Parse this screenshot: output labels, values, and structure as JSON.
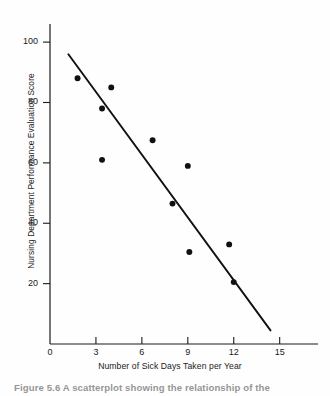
{
  "figure": {
    "caption_prefix": "Figure 5.6",
    "caption_text": "A scatterplot showing the relationship of the",
    "caption_full": "Figure 5.6  A scatterplot showing the relationship of the"
  },
  "chart_data": {
    "type": "scatter",
    "title": "",
    "xlabel": "Number of Sick Days Taken per Year",
    "ylabel": "Nursing Department Performance Evaluation Score",
    "xlim": [
      0,
      16
    ],
    "ylim": [
      0,
      106
    ],
    "xticks": [
      0,
      3,
      6,
      9,
      12,
      15
    ],
    "xtick_labels": [
      "0",
      "3",
      "6",
      "9",
      "12",
      "15"
    ],
    "yticks": [
      20,
      40,
      60,
      80,
      100
    ],
    "ytick_labels": [
      "20",
      "40",
      "60",
      "80",
      "100"
    ],
    "grid": false,
    "legend": "none",
    "marker": {
      "shape": "circle",
      "color": "#111111",
      "size": 4.6
    },
    "points": [
      {
        "x": 1.8,
        "y": 88.0
      },
      {
        "x": 3.4,
        "y": 78.0
      },
      {
        "x": 3.4,
        "y": 61.0
      },
      {
        "x": 4.0,
        "y": 85.0
      },
      {
        "x": 6.7,
        "y": 67.5
      },
      {
        "x": 8.0,
        "y": 46.5
      },
      {
        "x": 9.0,
        "y": 59.0
      },
      {
        "x": 9.1,
        "y": 30.5
      },
      {
        "x": 11.7,
        "y": 33.0
      },
      {
        "x": 12.0,
        "y": 20.5
      }
    ],
    "trendline": {
      "type": "linear-fit",
      "color": "#111111",
      "x_start": 1.2,
      "y_start": 96.0,
      "x_end": 14.4,
      "y_end": 4.5
    }
  }
}
